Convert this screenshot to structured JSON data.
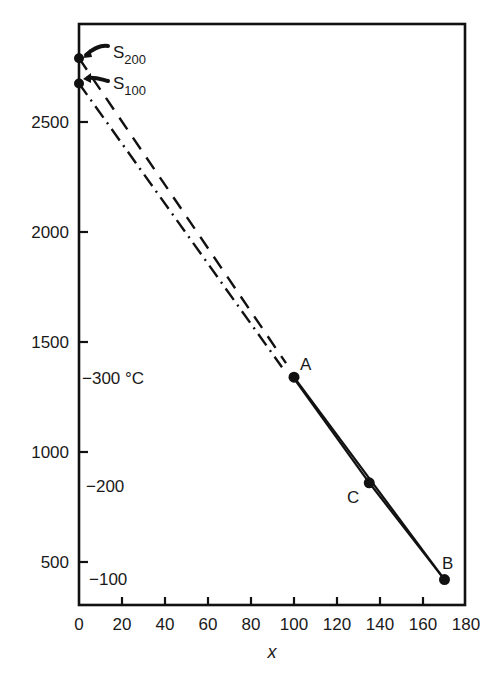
{
  "chart_data": {
    "type": "line",
    "title": "",
    "xlabel": "x",
    "ylabel": "",
    "xlim": [
      0,
      180
    ],
    "ylim": [
      305,
      2940
    ],
    "grid": false,
    "legend": null,
    "x_ticks": [
      0,
      20,
      40,
      60,
      80,
      100,
      120,
      140,
      160,
      180
    ],
    "y_ticks": [
      500,
      1000,
      1500,
      2000,
      2500
    ],
    "points": [
      {
        "name": "S200",
        "label": "S",
        "subscript": "200",
        "x": 0,
        "y": 2790
      },
      {
        "name": "S100",
        "label": "S",
        "subscript": "100",
        "x": 0,
        "y": 2675
      },
      {
        "name": "A",
        "label": "A",
        "x": 100,
        "y": 1340
      },
      {
        "name": "C",
        "label": "C",
        "x": 135,
        "y": 860
      },
      {
        "name": "B",
        "label": "B",
        "x": 170,
        "y": 420
      }
    ],
    "series": [
      {
        "name": "S200 to A",
        "style": "dashed",
        "x": [
          0,
          100
        ],
        "y": [
          2790,
          1340
        ]
      },
      {
        "name": "S100 to A",
        "style": "dash-dot",
        "x": [
          0,
          100
        ],
        "y": [
          2675,
          1340
        ]
      },
      {
        "name": "A to C",
        "style": "solid",
        "x": [
          100,
          135
        ],
        "y": [
          1340,
          860
        ]
      },
      {
        "name": "A to B",
        "style": "solid",
        "x": [
          100,
          170
        ],
        "y": [
          1340,
          420
        ]
      },
      {
        "name": "C to B",
        "style": "solid",
        "x": [
          135,
          170
        ],
        "y": [
          860,
          420
        ]
      }
    ],
    "annotations": [
      {
        "text": "−300 °C",
        "near_y": 1340,
        "position": "left-inside"
      },
      {
        "text": "−200",
        "near_y": 860,
        "position": "left-inside"
      },
      {
        "text": "−100",
        "near_y": 420,
        "position": "left-inside"
      }
    ]
  },
  "labels": {
    "x_axis_title": "x",
    "x_ticks": [
      "0",
      "20",
      "40",
      "60",
      "80",
      "100",
      "120",
      "140",
      "160",
      "180"
    ],
    "y_ticks": [
      "500",
      "1000",
      "1500",
      "2000",
      "2500"
    ],
    "s200_main": "S",
    "s200_sub": "200",
    "s100_main": "S",
    "s100_sub": "100",
    "point_a": "A",
    "point_b": "B",
    "point_c": "C",
    "temp_300": "−300 °C",
    "temp_200": "−200",
    "temp_100": "−100"
  }
}
